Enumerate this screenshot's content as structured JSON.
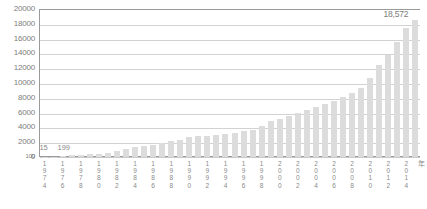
{
  "chart_data": {
    "type": "bar",
    "title": "",
    "subtitle": "",
    "xlabel": "年",
    "ylabel": "",
    "ylim": [
      0,
      20000
    ],
    "grid": true,
    "legend": null,
    "ytick_labels": [
      "20000",
      "18000",
      "16000",
      "14000",
      "12000",
      "10000",
      "8000",
      "6000",
      "4000",
      "2000",
      "100",
      "0"
    ],
    "ytick_values": [
      20000,
      18000,
      16000,
      14000,
      12000,
      10000,
      8000,
      6000,
      4000,
      2000,
      100,
      0
    ],
    "categories": [
      "1974",
      "1975",
      "1976",
      "1977",
      "1978",
      "1979",
      "1980",
      "1981",
      "1982",
      "1983",
      "1984",
      "1985",
      "1986",
      "1987",
      "1988",
      "1989",
      "1990",
      "1991",
      "1992",
      "1993",
      "1994",
      "1995",
      "1996",
      "1997",
      "1998",
      "1999",
      "2000",
      "2001",
      "2002",
      "2003",
      "2004",
      "2005",
      "2006",
      "2007",
      "2008",
      "2009",
      "2010",
      "2011",
      "2012",
      "2013",
      "2014",
      "2015"
    ],
    "xtick_labels": [
      "1974",
      "1976",
      "1978",
      "1980",
      "1982",
      "1984",
      "1986",
      "1988",
      "1990",
      "1992",
      "1994",
      "1996",
      "1998",
      "2000",
      "2002",
      "2004",
      "2006",
      "2008",
      "2010",
      "2012",
      "2014"
    ],
    "values": [
      15,
      60,
      199,
      230,
      300,
      380,
      470,
      600,
      780,
      1050,
      1300,
      1550,
      1600,
      1900,
      2150,
      2300,
      2650,
      2800,
      2900,
      3000,
      3100,
      3250,
      3500,
      3700,
      4200,
      4800,
      5200,
      5600,
      6000,
      6400,
      6800,
      7200,
      7600,
      8100,
      8600,
      9300,
      10700,
      12400,
      13800,
      15600,
      17400,
      18572
    ],
    "annotations": [
      {
        "label": "15",
        "category": "1974"
      },
      {
        "label": "199",
        "category": "1976"
      },
      {
        "label": "18,572",
        "category": "2015"
      }
    ],
    "bar_color": "#dcdcdc",
    "grid_color": "#d2d2d2",
    "axis_color": "#9a9a9a",
    "text_color": "#8a8a8a"
  }
}
